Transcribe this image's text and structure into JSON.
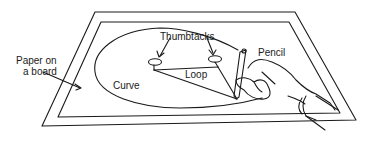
{
  "diagram": {
    "labels": {
      "paper": [
        "Paper on",
        "a board"
      ],
      "thumbtacks": "Thumbtacks",
      "pencil": "Pencil",
      "loop": "Loop",
      "curve": "Curve"
    },
    "colors": {
      "line": "#1a1a1a",
      "background": "#ffffff"
    }
  }
}
